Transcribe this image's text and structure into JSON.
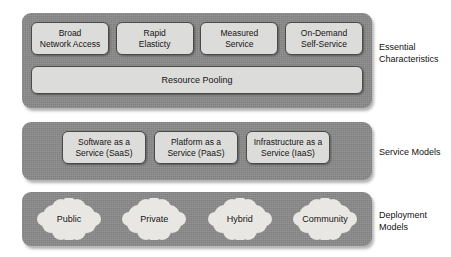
{
  "diagram": {
    "colors": {
      "band_fill": "#8b8b8b",
      "chip_fill": "#dcdcda",
      "chip_border": "#4a4a4a",
      "cloud_fill": "#e9e7e3",
      "text": "#141414",
      "page_background": "#ffffff"
    },
    "bands": [
      {
        "id": "essential-characteristics",
        "side_label_line1": "Essential",
        "side_label_line2": "Characteristics",
        "chips": [
          {
            "line1": "Broad",
            "line2": "Network Access"
          },
          {
            "line1": "Rapid",
            "line2": "Elasticty"
          },
          {
            "line1": "Measured",
            "line2": "Service"
          },
          {
            "line1": "On-Demand",
            "line2": "Self-Service"
          }
        ],
        "full_width_chip": "Resource Pooling"
      },
      {
        "id": "service-models",
        "side_label_line1": "Service Models",
        "side_label_line2": "",
        "chips": [
          {
            "line1": "Software as a",
            "line2": "Service (SaaS)"
          },
          {
            "line1": "Platform as a",
            "line2": "Service (PaaS)"
          },
          {
            "line1": "Infrastructure as a",
            "line2": "Service (IaaS)"
          }
        ]
      },
      {
        "id": "deployment-models",
        "side_label_line1": "Deployment",
        "side_label_line2": "Models",
        "clouds": [
          {
            "label": "Public"
          },
          {
            "label": "Private"
          },
          {
            "label": "Hybrid"
          },
          {
            "label": "Community"
          }
        ]
      }
    ]
  }
}
